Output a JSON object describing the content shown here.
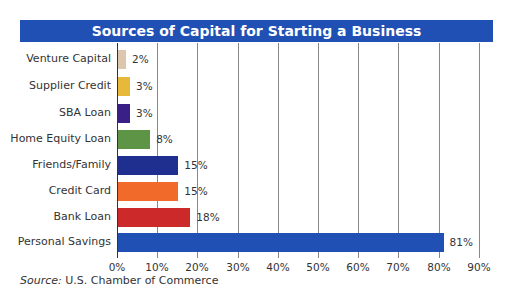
{
  "chart_data": {
    "type": "bar",
    "orientation": "horizontal",
    "title": "Sources of Capital for Starting a Business",
    "categories": [
      "Venture Capital",
      "Supplier Credit",
      "SBA Loan",
      "Home Equity Loan",
      "Friends/Family",
      "Credit Card",
      "Bank Loan",
      "Personal Savings"
    ],
    "values": [
      2,
      3,
      3,
      8,
      15,
      15,
      18,
      81
    ],
    "value_labels": [
      "2%",
      "3%",
      "3%",
      "8%",
      "15%",
      "15%",
      "18%",
      "81%"
    ],
    "colors": [
      "#dcc6ae",
      "#e6b93a",
      "#3a1f86",
      "#5e9446",
      "#1f2f8f",
      "#f26a2a",
      "#cc2a2a",
      "#2150b5"
    ],
    "xlabel": "",
    "ylabel": "",
    "xlim": [
      0,
      90
    ],
    "x_ticks": [
      "0%",
      "10%",
      "20%",
      "30%",
      "40%",
      "50%",
      "60%",
      "70%",
      "80%",
      "90%"
    ],
    "grid": true,
    "legend": null,
    "source_prefix": "Source:",
    "source_text": " U.S. Chamber of Commerce"
  },
  "colors": {
    "title_bar": "#2150b5",
    "gridline": "#888888"
  }
}
